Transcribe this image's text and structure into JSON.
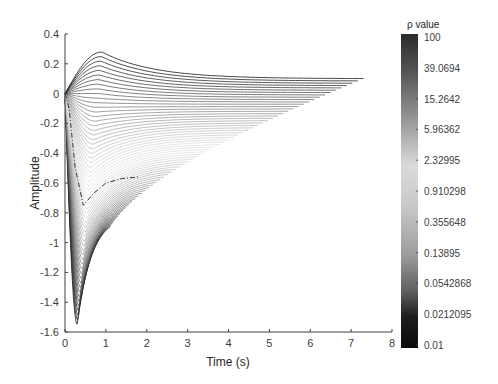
{
  "chart_data": {
    "type": "line",
    "title": "",
    "xlabel": "Time (s)",
    "ylabel": "Amplitude",
    "xlim": [
      0,
      8
    ],
    "ylim": [
      -1.6,
      0.4
    ],
    "xticks": [
      0,
      1,
      2,
      3,
      4,
      5,
      6,
      7,
      8
    ],
    "yticks": [
      0.4,
      0.2,
      0,
      -0.2,
      -0.4,
      -0.6,
      -0.8,
      -1,
      -1.2,
      -1.4,
      -1.6
    ],
    "xtick_labels": [
      "0",
      "1",
      "2",
      "3",
      "4",
      "5",
      "6",
      "7",
      "8"
    ],
    "ytick_labels": [
      "0.4",
      "0.2",
      "0",
      "-0.2",
      "-0.4",
      "-0.6",
      "-0.8",
      "-1",
      "-1.2",
      "-1.4",
      "-1.6"
    ],
    "grid": false,
    "series": [
      {
        "name": "rho=100 (darkest, top)",
        "x": [
          0,
          0.3,
          0.6,
          0.9,
          1.5,
          2.5,
          3.5,
          5,
          7.3
        ],
        "y": [
          0,
          0.2,
          0.27,
          0.28,
          0.24,
          0.15,
          0.11,
          0.1,
          0.1
        ]
      },
      {
        "name": "rho~15",
        "x": [
          0,
          0.3,
          0.6,
          1.0,
          2,
          3,
          4,
          5.3
        ],
        "y": [
          0,
          0.15,
          0.2,
          0.18,
          0.08,
          0.0,
          -0.02,
          -0.03
        ]
      },
      {
        "name": "rho~1 (lightest)",
        "x": [
          0,
          0.3,
          0.6,
          1.0,
          2,
          3,
          4.2
        ],
        "y": [
          0,
          -0.3,
          -0.35,
          -0.35,
          -0.4,
          -0.45,
          -0.46
        ]
      },
      {
        "name": "rho~0.1",
        "x": [
          0,
          0.2,
          0.4,
          0.7,
          1.0,
          1.4
        ],
        "y": [
          0,
          -0.9,
          -1.2,
          -1.0,
          -0.85,
          -0.8
        ]
      },
      {
        "name": "rho=0.01 (darkest, bottom)",
        "x": [
          0,
          0.15,
          0.3,
          0.5,
          0.8,
          1.1
        ],
        "y": [
          0,
          -1.2,
          -1.55,
          -1.3,
          -0.95,
          -0.82
        ]
      },
      {
        "name": "reference (dash-dot)",
        "style": "dashdot",
        "x": [
          0,
          0.1,
          0.25,
          0.45,
          0.7,
          1.0,
          1.4,
          1.8
        ],
        "y": [
          0,
          -0.1,
          -0.5,
          -0.75,
          -0.67,
          -0.6,
          -0.57,
          -0.56
        ]
      }
    ],
    "colorbar": {
      "label": "ρ value",
      "scale": "log",
      "colormap": "grayscale: dark at both ends, light in middle",
      "tick_labels": [
        "100",
        "39.0694",
        "15.2642",
        "5.96362",
        "2.32995",
        "0.910298",
        "0.355648",
        "0.13895",
        "0.0542868",
        "0.0212095",
        "0.01"
      ],
      "range": [
        0.01,
        100
      ]
    },
    "legend": null
  },
  "colors": {
    "axis": "#404040",
    "text": "#404040",
    "dark_curve": "#222222",
    "light_curve": "#d8d8d8"
  }
}
